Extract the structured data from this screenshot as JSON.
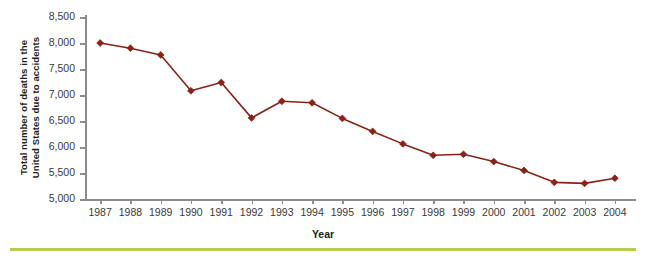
{
  "chart_data": {
    "type": "line",
    "title": "",
    "xlabel": "Year",
    "ylabel": "Total number of deaths in the United States due to accidents",
    "ylabel_lines": [
      "Total number of deaths in the",
      "United States due to accidents"
    ],
    "categories": [
      "1987",
      "1988",
      "1989",
      "1990",
      "1991",
      "1992",
      "1993",
      "1994",
      "1995",
      "1996",
      "1997",
      "1998",
      "1999",
      "2000",
      "2001",
      "2002",
      "2003",
      "2004"
    ],
    "values": [
      8000,
      7900,
      7770,
      7080,
      7240,
      6560,
      6880,
      6850,
      6550,
      6300,
      6060,
      5840,
      5860,
      5720,
      5550,
      5320,
      5300,
      5400
    ],
    "series": [
      {
        "name": "Total deaths due to accidents",
        "values": [
          8000,
          7900,
          7770,
          7080,
          7240,
          6560,
          6880,
          6850,
          6550,
          6300,
          6060,
          5840,
          5860,
          5720,
          5550,
          5320,
          5300,
          5400
        ]
      }
    ],
    "ylim": [
      5000,
      8500
    ],
    "ytick_values": [
      5000,
      5500,
      6000,
      6500,
      7000,
      7500,
      8000,
      8500
    ],
    "ytick_labels": [
      "5,000",
      "5,500",
      "6,000",
      "6,500",
      "7,000",
      "7,500",
      "8,000",
      "8,500"
    ],
    "grid": false,
    "legend": "none",
    "marker": "diamond",
    "line_color": "#8b2218",
    "marker_color": "#8b2218",
    "axis_color": "#8c8c8c",
    "accent_rule_color": "#b5cc4e",
    "background_color": "#ffffff"
  }
}
